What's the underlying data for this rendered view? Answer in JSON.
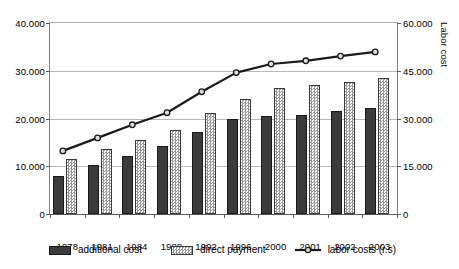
{
  "chart_data": {
    "type": "bar",
    "title": "",
    "xlabel": "",
    "ylabel": "",
    "y2label": "Labor cost",
    "grid": true,
    "legend_position": "bottom",
    "categories": [
      "1978",
      "1981",
      "1984",
      "1988",
      "1992",
      "1996",
      "2000",
      "2001",
      "2002",
      "2003"
    ],
    "ylim": [
      0,
      40000
    ],
    "yticks": [
      0,
      10000,
      20000,
      30000,
      40000
    ],
    "ytick_labels": [
      "0",
      "10.000",
      "20.000",
      "30.000",
      "40.000"
    ],
    "y2lim": [
      0,
      60000
    ],
    "y2ticks": [
      0,
      15000,
      30000,
      45000,
      60000
    ],
    "y2tick_labels": [
      "0",
      "15.000",
      "30.000",
      "45.000",
      "60.000"
    ],
    "series": [
      {
        "name": "additional cost",
        "kind": "bar",
        "axis": "left",
        "color": "#3b3b3b",
        "values": [
          8000,
          10300,
          12200,
          14200,
          17100,
          19900,
          20500,
          20800,
          21500,
          22300
        ]
      },
      {
        "name": "direct payment",
        "kind": "bar",
        "axis": "left",
        "color": "#9a9a9a",
        "values": [
          11500,
          13700,
          15500,
          17600,
          21200,
          24100,
          26400,
          27000,
          27600,
          28500
        ]
      },
      {
        "name": "labor costs (r.s)",
        "kind": "line",
        "axis": "right",
        "color": "#1a1a1a",
        "values": [
          19500,
          23600,
          27700,
          31500,
          38100,
          44100,
          46800,
          47800,
          49300,
          50600
        ]
      }
    ]
  },
  "legend": {
    "items": [
      {
        "label": "additional cost",
        "marker": "filled-square"
      },
      {
        "label": "direct payment",
        "marker": "checkered-square"
      },
      {
        "label": "labor costs (r.s)",
        "marker": "line-with-circle"
      }
    ]
  },
  "axes": {
    "left_title": "",
    "right_title": "Labor cost"
  }
}
